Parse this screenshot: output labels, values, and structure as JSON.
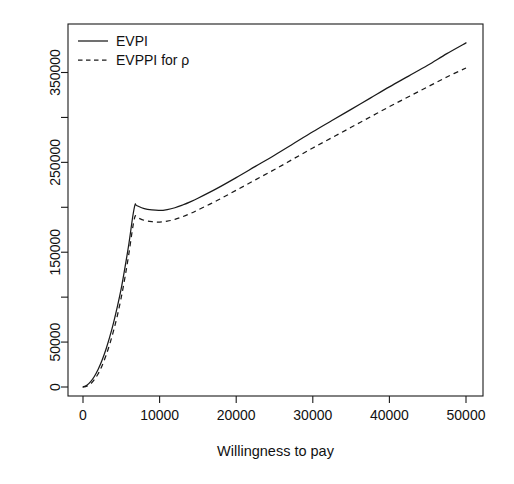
{
  "chart_data": {
    "type": "line",
    "title": "",
    "xlabel": "Willingness to pay",
    "ylabel": "",
    "xlim": [
      0,
      52000
    ],
    "ylim": [
      0,
      390000
    ],
    "grid": false,
    "legend_position": "top-left",
    "x_ticks": [
      {
        "value": 0,
        "label": "0",
        "labeled": true
      },
      {
        "value": 10000,
        "label": "10000",
        "labeled": true
      },
      {
        "value": 20000,
        "label": "20000",
        "labeled": true
      },
      {
        "value": 30000,
        "label": "30000",
        "labeled": true
      },
      {
        "value": 40000,
        "label": "40000",
        "labeled": true
      },
      {
        "value": 50000,
        "label": "50000",
        "labeled": true
      }
    ],
    "y_ticks": [
      {
        "value": 0,
        "label": "0",
        "labeled": true
      },
      {
        "value": 50000,
        "label": "50000",
        "labeled": true
      },
      {
        "value": 100000,
        "label": "",
        "labeled": false
      },
      {
        "value": 150000,
        "label": "150000",
        "labeled": true
      },
      {
        "value": 200000,
        "label": "",
        "labeled": false
      },
      {
        "value": 250000,
        "label": "250000",
        "labeled": true
      },
      {
        "value": 300000,
        "label": "",
        "labeled": false
      },
      {
        "value": 350000,
        "label": "350000",
        "labeled": true
      }
    ],
    "series": [
      {
        "name": "EVPI",
        "style": "solid",
        "color": "#1a1a1a",
        "x": [
          0,
          500,
          1000,
          1500,
          2000,
          2500,
          3000,
          3500,
          4000,
          4500,
          5000,
          5500,
          6000,
          6500,
          6800,
          7000,
          8000,
          9000,
          10000,
          11000,
          12000,
          13000,
          14000,
          15000,
          17500,
          20000,
          22500,
          25000,
          27500,
          30000,
          32500,
          35000,
          37500,
          40000,
          42500,
          45000,
          47500,
          50000
        ],
        "y": [
          0,
          2000,
          6000,
          12000,
          20000,
          30000,
          42000,
          56000,
          72000,
          90000,
          110000,
          134000,
          160000,
          190000,
          203000,
          202000,
          198500,
          197000,
          196500,
          197500,
          199500,
          202500,
          206000,
          210000,
          221000,
          233000,
          245500,
          258000,
          271000,
          284000,
          296500,
          309000,
          321500,
          334000,
          346000,
          358000,
          371000,
          383000
        ]
      },
      {
        "name": "EVPPI for ρ",
        "style": "dashed",
        "color": "#1a1a1a",
        "x": [
          0,
          500,
          1000,
          1500,
          2000,
          2500,
          3000,
          3500,
          4000,
          4500,
          5000,
          5500,
          6000,
          6500,
          6800,
          7000,
          8000,
          9000,
          10000,
          11000,
          12000,
          13000,
          14000,
          15000,
          17500,
          20000,
          22500,
          25000,
          27500,
          30000,
          32500,
          35000,
          37500,
          40000,
          42500,
          45000,
          47500,
          50000
        ],
        "y": [
          0,
          1000,
          3500,
          8500,
          15000,
          24000,
          35000,
          48000,
          63000,
          80000,
          100000,
          123000,
          149000,
          178000,
          190000,
          189000,
          185500,
          184000,
          183500,
          184500,
          186500,
          189500,
          193000,
          197000,
          207500,
          219000,
          230500,
          242000,
          254000,
          266000,
          277500,
          289000,
          300500,
          312000,
          323000,
          334000,
          345000,
          355000
        ]
      }
    ],
    "legend": [
      {
        "label": "EVPI",
        "style": "solid"
      },
      {
        "label": "EVPPI for ρ",
        "style": "dashed"
      }
    ]
  }
}
